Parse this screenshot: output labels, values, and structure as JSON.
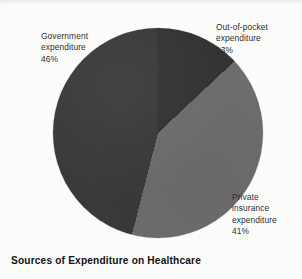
{
  "caption": "Sources of Expenditure on Healthcare",
  "colors": {
    "background": "#fbfbfa",
    "government": "#3a3a3c",
    "out_of_pocket": "#333336",
    "private_insurance": "#6e6e70",
    "text": "#2e2e2e",
    "caption_text": "#141414"
  },
  "labels": {
    "government": "Government\nexpenditure\n46%",
    "out_of_pocket": "Out-of-pocket\nexpenditure\n13%",
    "private_insurance": "Private\ninsurance\nexpenditure\n41%"
  },
  "chart_data": {
    "type": "pie",
    "title": "Sources of Expenditure on Healthcare",
    "xlabel": "",
    "ylabel": "",
    "legend": "none",
    "grid": false,
    "units": "percent",
    "total": 100,
    "start_angle_deg": 0,
    "direction": "clockwise",
    "categories": [
      "Out-of-pocket expenditure",
      "Private insurance expenditure",
      "Government expenditure"
    ],
    "values": [
      13,
      41,
      46
    ],
    "slices": [
      {
        "name": "Out-of-pocket expenditure",
        "value": 13,
        "label": "13%",
        "color": "#333336",
        "start_deg": 0,
        "end_deg": 46.8
      },
      {
        "name": "Private insurance expenditure",
        "value": 41,
        "label": "41%",
        "color": "#6e6e70",
        "start_deg": 46.8,
        "end_deg": 194.4
      },
      {
        "name": "Government expenditure",
        "value": 46,
        "label": "46%",
        "color": "#3a3a3c",
        "start_deg": 194.4,
        "end_deg": 360
      }
    ]
  }
}
